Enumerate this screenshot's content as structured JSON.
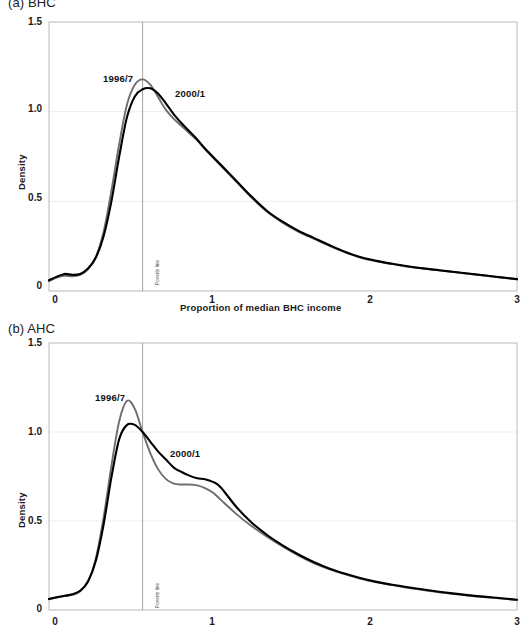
{
  "figure": {
    "panels": [
      {
        "id": "panel-a",
        "caption": "(a) BHC",
        "axis_note": "Poverty line"
      },
      {
        "id": "panel-b",
        "caption": "(b) AHC",
        "axis_note": "Poverty line"
      }
    ]
  },
  "chart_data": [
    {
      "type": "line",
      "panel": "(a) BHC",
      "title": "(a) BHC",
      "xlabel": "Proportion of median BHC income",
      "ylabel": "Density",
      "xlim": [
        0,
        3
      ],
      "ylim": [
        0,
        1.5
      ],
      "xticks": [
        "0",
        "1",
        "2",
        "3"
      ],
      "xtick_values": [
        0,
        1,
        2,
        3
      ],
      "yticks": [
        "0",
        "0.5",
        "1.0",
        "1.5"
      ],
      "ytick_values": [
        0,
        0.5,
        1.0,
        1.5
      ],
      "grid": "horizontal-faint",
      "legend": "inline-annotations",
      "annotations": [
        {
          "text": "1996/7",
          "x": 0.4,
          "y": 1.24,
          "series": "1996/7"
        },
        {
          "text": "2000/1",
          "x": 0.85,
          "y": 1.06,
          "series": "2000/1"
        },
        {
          "text": "Poverty line",
          "x": 0.6,
          "y": 0.12,
          "orientation": "vertical"
        }
      ],
      "reference_line": {
        "label": "Poverty line",
        "x": 0.6,
        "color": "#999999"
      },
      "x": [
        0.0,
        0.05,
        0.1,
        0.15,
        0.2,
        0.25,
        0.3,
        0.35,
        0.4,
        0.45,
        0.5,
        0.55,
        0.6,
        0.65,
        0.7,
        0.75,
        0.8,
        0.85,
        0.9,
        0.95,
        1.0,
        1.1,
        1.2,
        1.3,
        1.4,
        1.5,
        1.6,
        1.7,
        1.8,
        1.9,
        2.0,
        2.1,
        2.2,
        2.3,
        2.4,
        2.5,
        2.6,
        2.7,
        2.8,
        2.9,
        3.0
      ],
      "series": [
        {
          "name": "1996/7",
          "color": "#6e6e6e",
          "values": [
            0.055,
            0.075,
            0.085,
            0.082,
            0.09,
            0.12,
            0.19,
            0.33,
            0.56,
            0.82,
            1.04,
            1.15,
            1.18,
            1.15,
            1.08,
            1.01,
            0.96,
            0.92,
            0.88,
            0.84,
            0.79,
            0.7,
            0.61,
            0.52,
            0.44,
            0.38,
            0.33,
            0.29,
            0.25,
            0.215,
            0.185,
            0.165,
            0.15,
            0.135,
            0.125,
            0.115,
            0.105,
            0.095,
            0.085,
            0.075,
            0.065
          ]
        },
        {
          "name": "2000/1",
          "color": "#000000",
          "values": [
            0.06,
            0.08,
            0.095,
            0.09,
            0.095,
            0.125,
            0.185,
            0.305,
            0.5,
            0.75,
            0.97,
            1.085,
            1.125,
            1.13,
            1.1,
            1.045,
            0.985,
            0.935,
            0.89,
            0.845,
            0.795,
            0.705,
            0.615,
            0.525,
            0.445,
            0.385,
            0.335,
            0.295,
            0.255,
            0.218,
            0.188,
            0.168,
            0.152,
            0.138,
            0.126,
            0.116,
            0.106,
            0.096,
            0.086,
            0.076,
            0.066
          ]
        }
      ]
    },
    {
      "type": "line",
      "panel": "(b) AHC",
      "title": "(b) AHC",
      "xlabel": "Proportion of median BHC income",
      "ylabel": "Density",
      "xlim": [
        0,
        3
      ],
      "ylim": [
        0,
        1.5
      ],
      "xticks": [
        "0",
        "1",
        "2",
        "3"
      ],
      "xtick_values": [
        0,
        1,
        2,
        3
      ],
      "yticks": [
        "0",
        "0.5",
        "1.0",
        "1.5"
      ],
      "ytick_values": [
        0,
        0.5,
        1.0,
        1.5
      ],
      "grid": "horizontal-faint",
      "legend": "inline-annotations",
      "annotations": [
        {
          "text": "1996/7",
          "x": 0.36,
          "y": 1.22,
          "series": "1996/7"
        },
        {
          "text": "2000/1",
          "x": 0.82,
          "y": 0.9,
          "series": "2000/1"
        },
        {
          "text": "Poverty line",
          "x": 0.6,
          "y": 0.12,
          "orientation": "vertical"
        }
      ],
      "reference_line": {
        "label": "Poverty line",
        "x": 0.6,
        "color": "#999999"
      },
      "x": [
        0.0,
        0.05,
        0.1,
        0.15,
        0.2,
        0.25,
        0.3,
        0.35,
        0.4,
        0.45,
        0.5,
        0.55,
        0.6,
        0.65,
        0.7,
        0.75,
        0.8,
        0.85,
        0.9,
        0.95,
        1.0,
        1.05,
        1.1,
        1.2,
        1.3,
        1.4,
        1.5,
        1.6,
        1.7,
        1.8,
        1.9,
        2.0,
        2.1,
        2.2,
        2.3,
        2.4,
        2.5,
        2.6,
        2.7,
        2.8,
        2.9,
        3.0
      ],
      "series": [
        {
          "name": "1996/7",
          "color": "#6e6e6e",
          "values": [
            0.06,
            0.07,
            0.078,
            0.085,
            0.105,
            0.16,
            0.29,
            0.52,
            0.81,
            1.06,
            1.175,
            1.13,
            1.0,
            0.88,
            0.79,
            0.735,
            0.71,
            0.705,
            0.705,
            0.7,
            0.685,
            0.66,
            0.62,
            0.54,
            0.47,
            0.41,
            0.355,
            0.305,
            0.262,
            0.228,
            0.2,
            0.175,
            0.155,
            0.14,
            0.125,
            0.112,
            0.1,
            0.09,
            0.08,
            0.072,
            0.064,
            0.056
          ]
        },
        {
          "name": "2000/1",
          "color": "#000000",
          "values": [
            0.062,
            0.072,
            0.08,
            0.088,
            0.108,
            0.16,
            0.275,
            0.48,
            0.745,
            0.96,
            1.04,
            1.04,
            1.0,
            0.945,
            0.89,
            0.845,
            0.8,
            0.775,
            0.755,
            0.74,
            0.735,
            0.72,
            0.69,
            0.58,
            0.49,
            0.42,
            0.362,
            0.312,
            0.268,
            0.232,
            0.203,
            0.178,
            0.158,
            0.142,
            0.128,
            0.115,
            0.103,
            0.092,
            0.082,
            0.074,
            0.066,
            0.058
          ]
        }
      ]
    }
  ]
}
